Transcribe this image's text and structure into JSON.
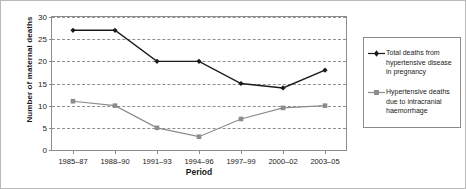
{
  "chart_data": {
    "type": "line",
    "title": "",
    "xlabel": "Period",
    "ylabel": "Number of maternal deaths",
    "categories": [
      "1985–87",
      "1988–90",
      "1991–93",
      "1994–96",
      "1997–99",
      "2000–02",
      "2003–05"
    ],
    "ylim": [
      0,
      30
    ],
    "yticks": [
      0,
      5,
      10,
      15,
      20,
      25,
      30
    ],
    "ytick_labels": [
      "0",
      "5",
      "10",
      "15",
      "20",
      "25",
      "30"
    ],
    "grid": "horizontal-dashed",
    "legend_position": "right-outside",
    "series": [
      {
        "name": "Total deaths from hypertensive disease in pregnancy",
        "color": "#1a1a1a",
        "marker": "diamond",
        "values": [
          27,
          27,
          20,
          20,
          15,
          14,
          18
        ]
      },
      {
        "name": "Hypertensive deaths due to intracranial haemorrhage",
        "color": "#8c8c8c",
        "marker": "square",
        "values": [
          11,
          10,
          5,
          3,
          7,
          9.5,
          10
        ]
      }
    ]
  },
  "legend": {
    "entries": [
      {
        "label": "Total deaths from hypertensive disease in pregnancy"
      },
      {
        "label": "Hypertensive deaths due to intracranial haemorrhage"
      }
    ]
  }
}
